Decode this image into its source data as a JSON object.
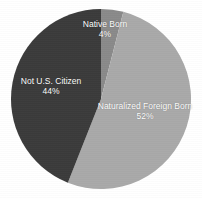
{
  "chart_data": {
    "type": "pie",
    "title": "",
    "subtitle": "",
    "xlabel": "",
    "ylabel": "",
    "legend_position": "none",
    "grid": false,
    "labels_on_slices": true,
    "unit": "%",
    "categories": [
      "Native Born",
      "Naturalized Foreign Born",
      "Not U.S. Citizen"
    ],
    "values": [
      4,
      52,
      44
    ],
    "total": 100,
    "start_angle_deg": 0,
    "direction": "clockwise",
    "slices": [
      {
        "name": "Native Born",
        "value": 4,
        "value_text": "4%",
        "color": "#8a8a8a",
        "start_angle_deg": 0,
        "end_angle_deg": 14.4
      },
      {
        "name": "Naturalized Foreign Born",
        "value": 52,
        "value_text": "52%",
        "color": "#a9a9a9",
        "start_angle_deg": 14.4,
        "end_angle_deg": 201.6
      },
      {
        "name": "Not U.S. Citizen",
        "value": 44,
        "value_text": "44%",
        "color": "#3b3b3b",
        "start_angle_deg": 201.6,
        "end_angle_deg": 360
      }
    ]
  },
  "figure": {
    "background": "#ffffff",
    "label_color": "#ffffff",
    "center_x": 101,
    "center_y": 99,
    "radius": 90
  },
  "labels": {
    "native_born": {
      "name": "Native Born",
      "percent": "4%"
    },
    "naturalized_foreign_born": {
      "name": "Naturalized Foreign Born",
      "percent": "52%"
    },
    "not_us_citizen": {
      "name": "Not U.S. Citizen",
      "percent": "44%"
    }
  }
}
